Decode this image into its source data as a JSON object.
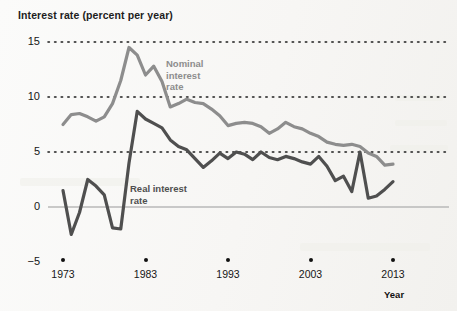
{
  "chart_data": {
    "type": "line",
    "title": "Interest rate (percent per year)",
    "xlabel": "Year",
    "ylabel": "Interest rate (percent per year)",
    "xlim": [
      1973,
      2013
    ],
    "ylim": [
      -5,
      15
    ],
    "yticks": [
      15,
      10,
      5,
      0,
      -5
    ],
    "ytick_labels": [
      "15",
      "10",
      "5",
      "0",
      "−5"
    ],
    "xticks": [
      1973,
      1983,
      1993,
      2003,
      2013
    ],
    "xtick_labels": [
      "1973",
      "1983",
      "1993",
      "2003",
      "2013"
    ],
    "grid": "dotted horizontal gridlines at 15, 10 and 5; solid zero line at 0",
    "legend_position": "inline annotations on plot",
    "x": [
      1973,
      1974,
      1975,
      1976,
      1977,
      1978,
      1979,
      1980,
      1981,
      1982,
      1983,
      1984,
      1985,
      1986,
      1987,
      1988,
      1989,
      1990,
      1991,
      1992,
      1993,
      1994,
      1995,
      1996,
      1997,
      1998,
      1999,
      2000,
      2001,
      2002,
      2003,
      2004,
      2005,
      2006,
      2007,
      2008,
      2009,
      2010,
      2011,
      2012,
      2013
    ],
    "series": [
      {
        "name": "Nominal interest rate",
        "color": "#8d8d8d",
        "annotation": "Nominal\ninterest\nrate",
        "values": [
          7.5,
          8.4,
          8.5,
          8.2,
          7.8,
          8.2,
          9.4,
          11.5,
          14.5,
          13.8,
          12.0,
          12.8,
          11.4,
          9.1,
          9.4,
          9.8,
          9.5,
          9.4,
          8.9,
          8.3,
          7.4,
          7.6,
          7.7,
          7.6,
          7.3,
          6.7,
          7.1,
          7.7,
          7.3,
          7.1,
          6.7,
          6.4,
          5.9,
          5.7,
          5.6,
          5.7,
          5.5,
          4.9,
          4.6,
          3.8,
          3.9
        ]
      },
      {
        "name": "Real interest rate",
        "color": "#4f4f4f",
        "annotation": "Real interest\nrate",
        "values": [
          1.5,
          -2.5,
          -0.5,
          2.5,
          1.9,
          1.1,
          -1.9,
          -2.0,
          4.0,
          8.7,
          8.0,
          7.6,
          7.2,
          6.1,
          5.5,
          5.2,
          4.4,
          3.6,
          4.2,
          4.9,
          4.4,
          5.0,
          4.8,
          4.3,
          5.0,
          4.5,
          4.3,
          4.6,
          4.4,
          4.1,
          3.9,
          4.6,
          3.7,
          2.4,
          2.8,
          1.4,
          5.0,
          0.8,
          1.0,
          1.6,
          2.3
        ]
      }
    ]
  },
  "axis_name_label": "Year"
}
